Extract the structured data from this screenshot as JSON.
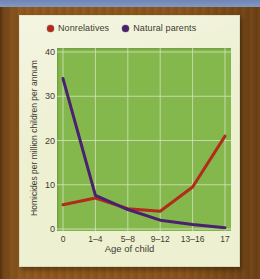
{
  "chart_data": {
    "type": "line",
    "title": "",
    "xlabel": "Age of child",
    "ylabel": "Homicides per million children per annum",
    "categories": [
      "0",
      "1–4",
      "5–8",
      "9–12",
      "13–16",
      "17"
    ],
    "yticks": [
      0,
      10,
      20,
      30,
      40
    ],
    "ylim": [
      0,
      40
    ],
    "grid": true,
    "legend_position": "top",
    "series": [
      {
        "name": "Nonrelatives",
        "color": "#b32b1b",
        "values": [
          5.5,
          7.0,
          4.6,
          4.0,
          9.5,
          21.0
        ]
      },
      {
        "name": "Natural parents",
        "color": "#4a2070",
        "values": [
          34.0,
          7.6,
          4.4,
          2.0,
          1.0,
          0.3
        ]
      }
    ]
  },
  "legend": {
    "items": [
      {
        "label": "Nonrelatives",
        "color": "#b32b1b",
        "dot": "legend-dot-red"
      },
      {
        "label": "Natural parents",
        "color": "#4a2070",
        "dot": "legend-dot-purple"
      }
    ]
  },
  "colors": {
    "plot_background": "#84b84c",
    "card_background": "#eef0d2",
    "frame": "#8d5a1c",
    "sky": "#7b93c0",
    "gridline": "#d7e6c4",
    "text": "#3c3c30"
  }
}
